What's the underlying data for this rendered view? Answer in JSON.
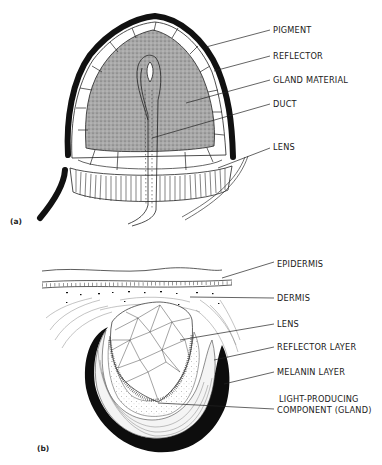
{
  "figure": {
    "panel_a": {
      "tag": "(a)",
      "labels": [
        "PIGMENT",
        "REFLECTOR",
        "GLAND MATERIAL",
        "DUCT",
        "LENS"
      ]
    },
    "panel_b": {
      "tag": "(b)",
      "labels": [
        "EPIDERMIS",
        "DERMIS",
        "LENS",
        "REFLECTOR LAYER",
        "MELANIN LAYER",
        "LIGHT-PRODUCING",
        "COMPONENT (GLAND)"
      ]
    }
  },
  "colors": {
    "ink": "#111111",
    "gland_fill": "#9a9a9a",
    "background": "#ffffff"
  }
}
